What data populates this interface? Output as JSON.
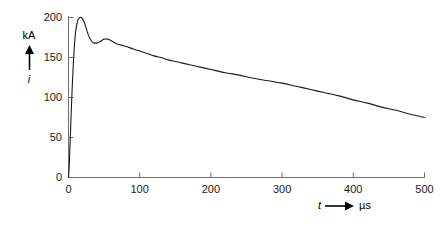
{
  "chart_data": {
    "type": "line",
    "title": "",
    "subtitle": "",
    "xlabel": "t",
    "ylabel": "i",
    "x_unit": "µs",
    "y_unit": "kA",
    "xlim": [
      0,
      500
    ],
    "ylim": [
      0,
      200
    ],
    "xticks": [
      0,
      100,
      200,
      300,
      400,
      500
    ],
    "yticks": [
      0,
      50,
      100,
      150,
      200
    ],
    "xtick_labels": [
      "0",
      "100",
      "200",
      "300",
      "400",
      "500"
    ],
    "ytick_labels": [
      "0",
      "50",
      "100",
      "150",
      "200"
    ],
    "grid": false,
    "legend": false,
    "legend_position": "none",
    "line_color": "#1a1a1a",
    "axis_color": "#6e6e6e",
    "background_color": "#ffffff",
    "annotations": [],
    "series": [
      {
        "name": "i",
        "x": [
          0,
          1,
          2,
          3,
          4,
          5,
          6,
          7,
          8,
          9,
          10,
          12,
          14,
          16,
          18,
          20,
          22,
          24,
          26,
          28,
          30,
          32,
          34,
          36,
          38,
          40,
          42,
          45,
          48,
          50,
          52,
          55,
          58,
          60,
          64,
          68,
          72,
          76,
          80,
          90,
          100,
          110,
          120,
          130,
          140,
          150,
          160,
          170,
          180,
          190,
          200,
          220,
          240,
          260,
          280,
          300,
          320,
          340,
          360,
          380,
          400,
          420,
          440,
          460,
          480,
          500
        ],
        "values": [
          0,
          14,
          38,
          62,
          86,
          108,
          128,
          146,
          161,
          173,
          182,
          193,
          198,
          200,
          200,
          198,
          194,
          189,
          183,
          178,
          174,
          171,
          169,
          168,
          168,
          168,
          169,
          170,
          172,
          173,
          173,
          173,
          172,
          171,
          169,
          167,
          166,
          165,
          164,
          161,
          158,
          155,
          152,
          150,
          147,
          145,
          143,
          141,
          139,
          137,
          135,
          131,
          128,
          124,
          121,
          118,
          114,
          110,
          106,
          102,
          97,
          93,
          88,
          84,
          79,
          75
        ]
      }
    ]
  },
  "axis_labels": {
    "y_unit": "kA",
    "y_symbol": "i",
    "x_symbol": "t",
    "x_unit": "µs"
  }
}
